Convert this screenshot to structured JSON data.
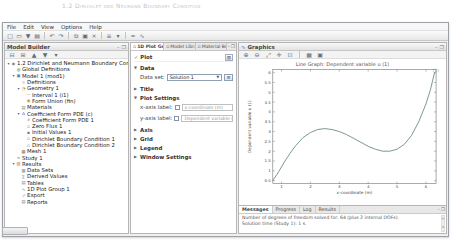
{
  "caption": "1.2 Dirichlet and Neumann Boundary Condition",
  "menu": {
    "items": [
      "File",
      "Edit",
      "View",
      "Options",
      "Help"
    ]
  },
  "toolbar": {
    "icons": [
      {
        "name": "new-icon",
        "glyph": "□"
      },
      {
        "name": "open-icon",
        "glyph": "▭"
      },
      {
        "name": "save-icon",
        "glyph": "▼"
      },
      {
        "name": "print-icon",
        "glyph": "▤"
      },
      {
        "name": "sep"
      },
      {
        "name": "undo-icon",
        "glyph": "↶"
      },
      {
        "name": "redo-icon",
        "glyph": "↷"
      },
      {
        "name": "sep"
      },
      {
        "name": "copy-icon",
        "glyph": "⧉"
      },
      {
        "name": "paste-icon",
        "glyph": "▣"
      },
      {
        "name": "delete-icon",
        "glyph": "×"
      },
      {
        "name": "sep"
      },
      {
        "name": "options-dropdown-icon",
        "glyph": "≡"
      },
      {
        "name": "dropdown-caret-icon",
        "glyph": "▾"
      },
      {
        "name": "sep"
      },
      {
        "name": "compute-icon",
        "glyph": "="
      },
      {
        "name": "plot-icon",
        "glyph": "∿"
      }
    ]
  },
  "model_builder": {
    "title": "Model Builder",
    "window_buttons": [
      "–",
      "❐"
    ],
    "tree_toolbar": [
      {
        "name": "collapse-all-icon",
        "glyph": "⊟"
      },
      {
        "name": "expand-all-icon",
        "glyph": "⊞"
      },
      {
        "name": "move-up-icon",
        "glyph": "▲"
      },
      {
        "name": "move-down-icon",
        "glyph": "▼"
      },
      {
        "name": "show-options-icon",
        "glyph": "▾"
      }
    ],
    "tree": [
      {
        "label": "1.2 Dirichlet and Neumann Boundary Condition",
        "level": 0,
        "icon": "model-root",
        "expanded": true
      },
      {
        "label": "Global Definitions",
        "level": 1,
        "icon": "globe",
        "expanded": false
      },
      {
        "label": "Model 1 (mod1)",
        "level": 1,
        "icon": "model",
        "expanded": true
      },
      {
        "label": "Definitions",
        "level": 2,
        "icon": "definitions",
        "expanded": false
      },
      {
        "label": "Geometry 1",
        "level": 2,
        "icon": "geometry",
        "expanded": true
      },
      {
        "label": "Interval 1 (i1)",
        "level": 3,
        "icon": "interval",
        "expanded": false
      },
      {
        "label": "Form Union (fin)",
        "level": 3,
        "icon": "form-union",
        "expanded": false
      },
      {
        "label": "Materials",
        "level": 2,
        "icon": "materials",
        "expanded": false
      },
      {
        "label": "Coefficient Form PDE (c)",
        "level": 2,
        "icon": "physics",
        "expanded": true
      },
      {
        "label": "Coefficient Form PDE 1",
        "level": 3,
        "icon": "pde-node",
        "expanded": false
      },
      {
        "label": "Zero Flux 1",
        "level": 3,
        "icon": "flux-node",
        "expanded": false
      },
      {
        "label": "Initial Values 1",
        "level": 3,
        "icon": "init-node",
        "expanded": false
      },
      {
        "label": "Dirichlet Boundary Condition 1",
        "level": 3,
        "icon": "bc-node",
        "expanded": false
      },
      {
        "label": "Dirichlet Boundary Condition 2",
        "level": 3,
        "icon": "bc-node",
        "expanded": false
      },
      {
        "label": "Mesh 1",
        "level": 2,
        "icon": "mesh",
        "expanded": false
      },
      {
        "label": "Study 1",
        "level": 1,
        "icon": "study",
        "expanded": false
      },
      {
        "label": "Results",
        "level": 1,
        "icon": "results",
        "expanded": true
      },
      {
        "label": "Data Sets",
        "level": 2,
        "icon": "data-sets",
        "expanded": false
      },
      {
        "label": "Derived Values",
        "level": 2,
        "icon": "derived-values",
        "expanded": false
      },
      {
        "label": "Tables",
        "level": 2,
        "icon": "tables",
        "expanded": false
      },
      {
        "label": "1D Plot Group 1",
        "level": 2,
        "icon": "plot-group",
        "expanded": false
      },
      {
        "label": "Export",
        "level": 2,
        "icon": "export",
        "expanded": false
      },
      {
        "label": "Reports",
        "level": 2,
        "icon": "reports",
        "expanded": false
      }
    ]
  },
  "settings": {
    "tabs": [
      {
        "label": "1D Plot Gro...",
        "active": true
      },
      {
        "label": "Model Librar...",
        "active": false
      },
      {
        "label": "Material Bro...",
        "active": false
      }
    ],
    "window_buttons": [
      "–",
      "❐"
    ],
    "header": {
      "label": "Plot",
      "button_glyph": "⊞"
    },
    "sections": [
      {
        "label": "Data",
        "expanded": true,
        "rows": [
          {
            "kind": "select",
            "label": "Data set:",
            "value": "Solution 1",
            "button_glyph": "⊞"
          }
        ]
      },
      {
        "label": "Title",
        "expanded": false,
        "rows": []
      },
      {
        "label": "Plot Settings",
        "expanded": true,
        "rows": [
          {
            "kind": "checkbox-field",
            "label": "x-axis label:",
            "checked": false,
            "value": "x-coordinate (m)"
          },
          {
            "kind": "checkbox-field",
            "label": "y-axis label:",
            "checked": false,
            "value": "Dependent variable u (1)"
          }
        ]
      },
      {
        "label": "Axis",
        "expanded": false,
        "rows": []
      },
      {
        "label": "Grid",
        "expanded": false,
        "rows": []
      },
      {
        "label": "Legend",
        "expanded": false,
        "rows": []
      },
      {
        "label": "Window Settings",
        "expanded": false,
        "rows": []
      }
    ]
  },
  "graphics": {
    "title": "Graphics",
    "window_buttons": [
      "–",
      "❐"
    ],
    "toolbar": [
      {
        "name": "zoom-in-icon",
        "glyph": "⊕"
      },
      {
        "name": "zoom-out-icon",
        "glyph": "⊖"
      },
      {
        "name": "zoom-extents-icon",
        "glyph": "⤢"
      },
      {
        "name": "pan-icon",
        "glyph": "✛"
      },
      {
        "name": "zoom-box-icon",
        "glyph": "⊡"
      },
      {
        "name": "sep"
      },
      {
        "name": "grid-icon",
        "glyph": "▦"
      },
      {
        "name": "snapshot-icon",
        "glyph": "▣"
      }
    ],
    "corner_label": "(1)"
  },
  "messages": {
    "tabs": [
      {
        "label": "Messages",
        "active": true
      },
      {
        "label": "Progress",
        "active": false
      },
      {
        "label": "Log",
        "active": false
      },
      {
        "label": "Results",
        "active": false
      }
    ],
    "window_buttons": [
      "–",
      "❐"
    ],
    "lines": [
      "Number of degrees of freedom solved for: 64 (plus 2 internal DOFs).",
      "Solution time (Study 1): 1 s."
    ]
  },
  "chart_data": {
    "type": "line",
    "title": "Line Graph: Dependent variable u (1)",
    "xlabel": "x-coordinate (m)",
    "ylabel": "Dependent variable u (1)",
    "xlim": [
      0.7,
      6.35
    ],
    "ylim": [
      0.35,
      6.15
    ],
    "xticks": [
      1,
      2,
      3,
      4,
      5,
      6
    ],
    "yticks": [
      0.5,
      1,
      1.5,
      2,
      2.5,
      3,
      3.5,
      4,
      4.5,
      5,
      5.5,
      6
    ],
    "grid": false,
    "legend": "none",
    "series": [
      {
        "name": "u",
        "color": "#6b8c7c",
        "x": [
          0.7,
          0.9,
          1.1,
          1.3,
          1.5,
          1.75,
          2.0,
          2.25,
          2.5,
          2.75,
          3.0,
          3.25,
          3.5,
          3.75,
          4.0,
          4.25,
          4.5,
          4.75,
          5.0,
          5.25,
          5.5,
          5.75,
          6.0,
          6.15,
          6.3
        ],
        "y": [
          0.5,
          0.95,
          1.45,
          1.9,
          2.3,
          2.7,
          2.95,
          3.1,
          3.15,
          3.1,
          3.0,
          2.85,
          2.65,
          2.45,
          2.25,
          2.1,
          2.0,
          2.0,
          2.1,
          2.35,
          2.8,
          3.5,
          4.4,
          5.1,
          6.0
        ]
      }
    ]
  }
}
